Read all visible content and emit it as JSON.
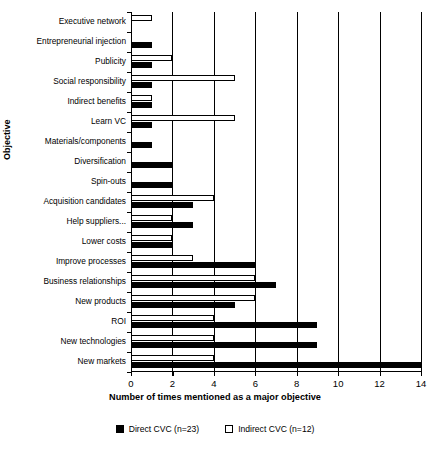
{
  "chart_data": {
    "type": "bar",
    "orientation": "horizontal",
    "title": "",
    "xlabel": "Number of times mentioned as a major objective",
    "ylabel": "Objective",
    "xlim": [
      0,
      14
    ],
    "xticks": [
      0,
      2,
      4,
      6,
      8,
      10,
      12,
      14
    ],
    "grid": true,
    "grid_axis": "x",
    "legend_position": "bottom",
    "categories": [
      "Executive network",
      "Entrepreneurial injection",
      "Publicity",
      "Social  responsibility",
      "Indirect benefits",
      "Learn  VC",
      "Materials/components",
      "Diversification",
      "Spin-outs",
      "Acquisition candidates",
      "Help suppliers...",
      "Lower costs",
      "Improve processes",
      "Business relationships",
      "New products",
      "ROI",
      "New technologies",
      "New  markets"
    ],
    "series": [
      {
        "name": "Direct CVC (n=23)",
        "color": "#000000",
        "style": "filled",
        "values": [
          0,
          1,
          1,
          1,
          1,
          1,
          1,
          2,
          2,
          3,
          3,
          2,
          6,
          7,
          5,
          9,
          9,
          14
        ]
      },
      {
        "name": "Indirect CVC (n=12)",
        "color": "#ffffff",
        "style": "outline",
        "values": [
          1,
          0,
          2,
          5,
          1,
          5,
          0,
          0,
          0,
          4,
          2,
          2,
          3,
          6,
          6,
          4,
          4,
          4
        ]
      }
    ]
  },
  "legend": {
    "items": [
      {
        "label": "Direct CVC (n=23)",
        "swatch": "filled-black"
      },
      {
        "label": "Indirect CVC (n=12)",
        "swatch": "outline-white"
      }
    ]
  }
}
